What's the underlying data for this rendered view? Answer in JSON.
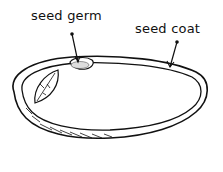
{
  "diagram": {
    "labels": [
      {
        "id": "germ",
        "text": "seed germ"
      },
      {
        "id": "coat",
        "text": "seed coat"
      }
    ],
    "colors": {
      "stroke": "#111111",
      "background": "#ffffff"
    }
  }
}
